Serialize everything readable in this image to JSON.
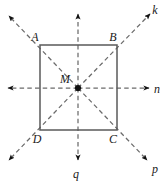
{
  "figure": {
    "type": "geometry-diagram",
    "canvas": {
      "width": 165,
      "height": 181,
      "background": "#ffffff"
    },
    "colors": {
      "square_stroke": "#5a5a5a",
      "dashed_stroke": "#6b6b6b",
      "arrow_fill": "#111111",
      "point_fill": "#111111",
      "label_color": "#1a1a1a"
    },
    "square": {
      "name": "square-ABCD",
      "stroke_width": 1.4,
      "corners": [
        {
          "id": "A",
          "label": "A",
          "x": 40,
          "y": 45,
          "label_x": 35,
          "label_y": 41
        },
        {
          "id": "B",
          "label": "B",
          "x": 117,
          "y": 45,
          "label_x": 112,
          "label_y": 41
        },
        {
          "id": "C",
          "label": "C",
          "x": 117,
          "y": 130,
          "label_x": 112,
          "label_y": 143
        },
        {
          "id": "D",
          "label": "D",
          "x": 40,
          "y": 130,
          "label_x": 36,
          "label_y": 143
        }
      ]
    },
    "center": {
      "name": "point-M",
      "label": "M",
      "x": 78,
      "y": 88,
      "radius": 3.1,
      "label_x": 64,
      "label_y": 82
    },
    "rays": [
      {
        "id": "ray-up-right",
        "label": "k",
        "end_x": 150,
        "end_y": 14,
        "label_x": 154,
        "label_y": 12,
        "has_label": true,
        "direction": "up-right"
      },
      {
        "id": "ray-right",
        "label": "n",
        "end_x": 149,
        "end_y": 88,
        "label_x": 154,
        "label_y": 92,
        "has_label": true,
        "direction": "right"
      },
      {
        "id": "ray-down-right",
        "label": "p",
        "end_x": 147,
        "end_y": 160,
        "label_x": 152,
        "label_y": 171,
        "has_label": true,
        "direction": "down-right"
      },
      {
        "id": "ray-down",
        "label": "q",
        "end_x": 78,
        "end_y": 160,
        "label_x": 74,
        "label_y": 177,
        "has_label": true,
        "direction": "down"
      },
      {
        "id": "ray-down-left",
        "label": "",
        "end_x": 9,
        "end_y": 160,
        "label_x": 0,
        "label_y": 0,
        "has_label": false,
        "direction": "down-left"
      },
      {
        "id": "ray-left",
        "label": "",
        "end_x": 8,
        "end_y": 88,
        "label_x": 0,
        "label_y": 0,
        "has_label": false,
        "direction": "left"
      },
      {
        "id": "ray-up-left",
        "label": "",
        "end_x": 9,
        "end_y": 16,
        "label_x": 0,
        "label_y": 0,
        "has_label": false,
        "direction": "up-left"
      },
      {
        "id": "ray-up",
        "label": "",
        "end_x": 78,
        "end_y": 14,
        "label_x": 0,
        "label_y": 0,
        "has_label": false,
        "direction": "up"
      }
    ],
    "labels": {
      "A": "A",
      "B": "B",
      "C": "C",
      "D": "D",
      "M": "M",
      "k": "k",
      "n": "n",
      "p": "p",
      "q": "q"
    }
  }
}
